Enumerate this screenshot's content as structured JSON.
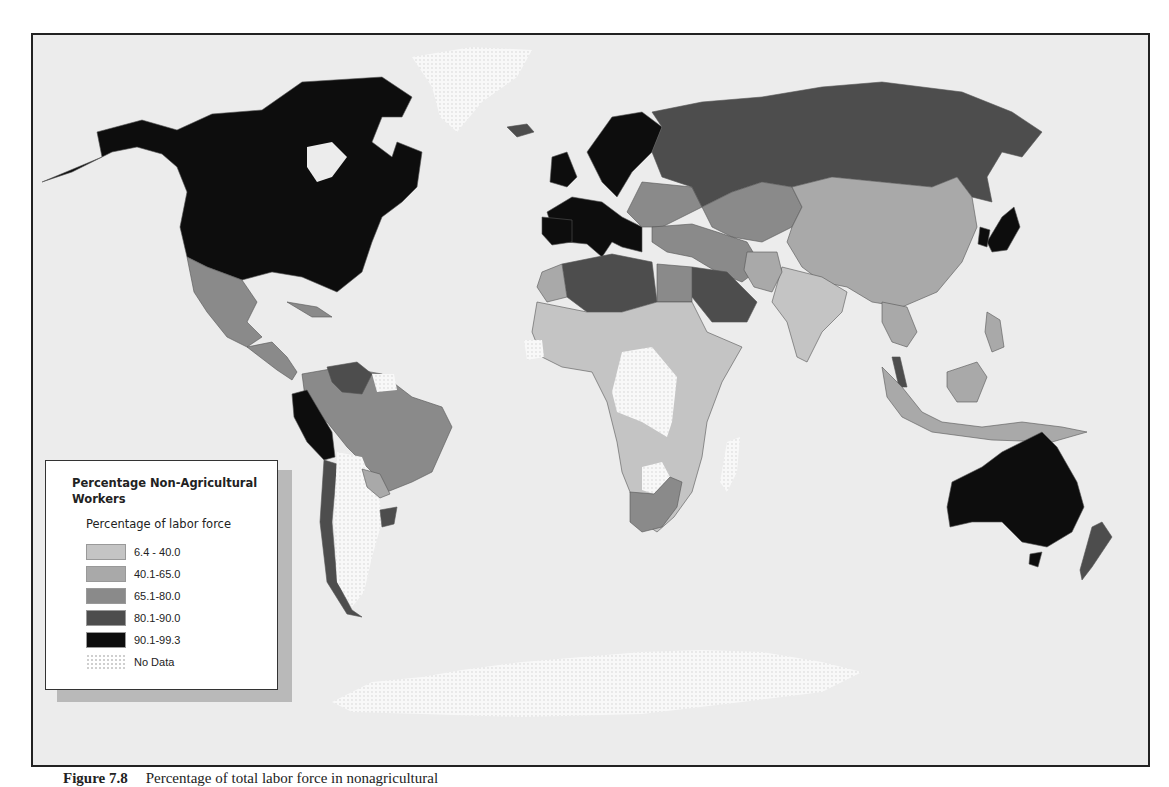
{
  "legend": {
    "title": "Percentage Non-Agricultural Workers",
    "subtitle": "Percentage of labor force",
    "classes": [
      {
        "label": "6.4 - 40.0",
        "color": "#c4c4c4"
      },
      {
        "label": "40.1-65.0",
        "color": "#a9a9a9"
      },
      {
        "label": "65.1-80.0",
        "color": "#8a8a8a"
      },
      {
        "label": "80.1-90.0",
        "color": "#4d4d4d"
      },
      {
        "label": "90.1-99.3",
        "color": "#0d0d0d"
      },
      {
        "label": "No Data",
        "color": "dotted"
      }
    ]
  },
  "caption": {
    "figure_label": "Figure 7.8",
    "text": "Percentage of total labor force in nonagricultural"
  },
  "map": {
    "ocean_color": "#ececec",
    "regions": [
      {
        "name": "North America (USA/Canada)",
        "class": "90.1-99.3"
      },
      {
        "name": "Greenland",
        "class": "No Data"
      },
      {
        "name": "Mexico",
        "class": "65.1-80.0"
      },
      {
        "name": "Central America",
        "class": "65.1-80.0"
      },
      {
        "name": "Venezuela",
        "class": "80.1-90.0"
      },
      {
        "name": "Colombia",
        "class": "65.1-80.0"
      },
      {
        "name": "Brazil",
        "class": "65.1-80.0"
      },
      {
        "name": "Peru/Ecuador",
        "class": "90.1-99.3"
      },
      {
        "name": "Chile",
        "class": "80.1-90.0"
      },
      {
        "name": "Argentina",
        "class": "No Data"
      },
      {
        "name": "Paraguay",
        "class": "40.1-65.0"
      },
      {
        "name": "Uruguay",
        "class": "80.1-90.0"
      },
      {
        "name": "Western Europe",
        "class": "90.1-99.3"
      },
      {
        "name": "Russia",
        "class": "80.1-90.0"
      },
      {
        "name": "Central Asia",
        "class": "65.1-80.0"
      },
      {
        "name": "China/Mongolia",
        "class": "40.1-65.0"
      },
      {
        "name": "India",
        "class": "6.4 - 40.0"
      },
      {
        "name": "Japan/South Korea",
        "class": "90.1-99.3"
      },
      {
        "name": "North Africa (Algeria/Libya)",
        "class": "80.1-90.0"
      },
      {
        "name": "Saudi Arabia",
        "class": "80.1-90.0"
      },
      {
        "name": "Sub-Saharan Africa",
        "class": "6.4 - 40.0"
      },
      {
        "name": "DR Congo",
        "class": "No Data"
      },
      {
        "name": "South Africa",
        "class": "65.1-80.0"
      },
      {
        "name": "Madagascar",
        "class": "No Data"
      },
      {
        "name": "Southeast Asia",
        "class": "40.1-65.0"
      },
      {
        "name": "Australia",
        "class": "90.1-99.3"
      },
      {
        "name": "New Zealand",
        "class": "80.1-90.0"
      },
      {
        "name": "Antarctica",
        "class": "No Data"
      }
    ]
  }
}
